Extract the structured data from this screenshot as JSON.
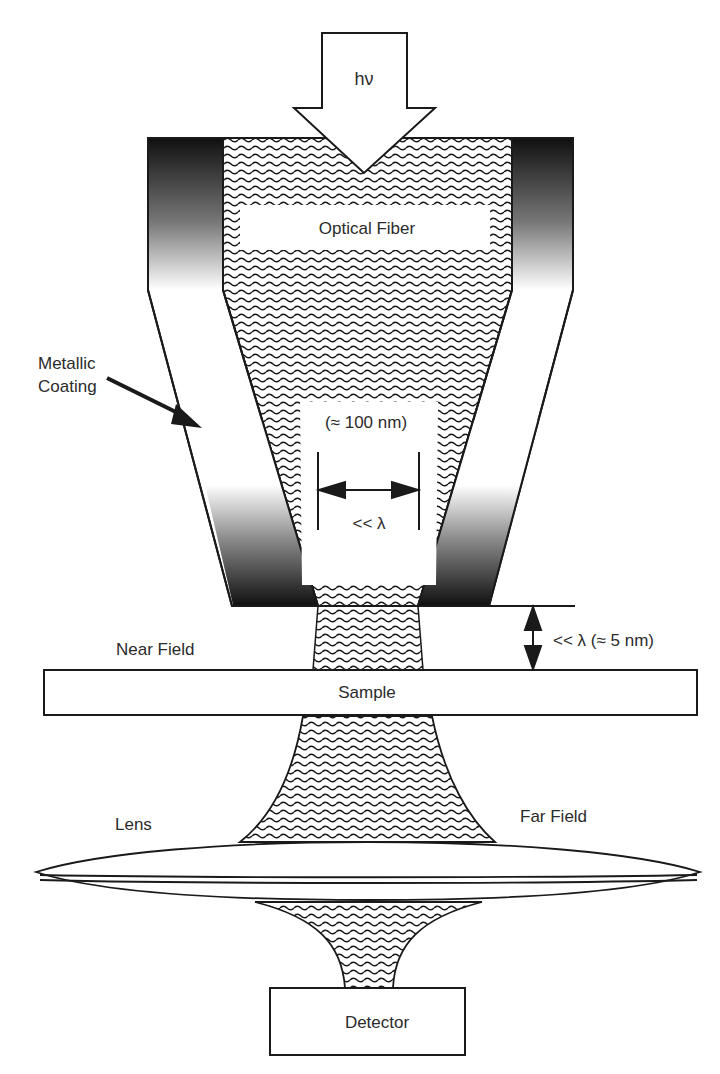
{
  "diagram": {
    "labels": {
      "photon": "hν",
      "optical_fiber": "Optical Fiber",
      "metallic_coating_line1": "Metallic",
      "metallic_coating_line2": "Coating",
      "aperture_size": "(≈ 100 nm)",
      "aperture_relation": "<< λ",
      "gap_relation": "<< λ (≈ 5 nm)",
      "near_field": "Near Field",
      "sample": "Sample",
      "lens": "Lens",
      "far_field": "Far Field",
      "detector": "Detector"
    },
    "colors": {
      "stroke": "#1a1a1a",
      "coating_dark": "#111111",
      "coating_light": "#ffffff",
      "background": "#ffffff"
    }
  }
}
